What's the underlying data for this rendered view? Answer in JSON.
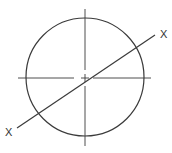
{
  "diagram": {
    "type": "circle-section-line",
    "labels": {
      "left_end": "X",
      "right_end": "X"
    },
    "colors": {
      "line": "#3a3a3a",
      "text": "#333333",
      "background": "#ffffff"
    }
  }
}
